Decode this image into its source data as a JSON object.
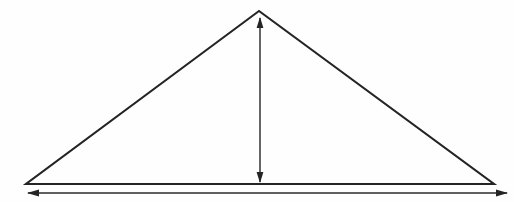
{
  "figure": {
    "type": "geometric-line-diagram",
    "background_color": "#fefefe",
    "line_color": "#242424",
    "canvas": {
      "width": 514,
      "height": 202
    },
    "title": "",
    "caption": ""
  },
  "geometry": {
    "triangle": {
      "name": "triangle-outline",
      "apex": {
        "x": 259,
        "y": 11
      },
      "bottom_left": {
        "x": 26,
        "y": 184
      },
      "bottom_right": {
        "x": 494,
        "y": 184
      },
      "stroke_width": 2.1,
      "closed": true
    },
    "height_arrow": {
      "name": "height-dimension-arrow",
      "orientation": "vertical",
      "double_headed": true,
      "x": 260,
      "y_top": 18,
      "y_bottom": 182,
      "head_length": 11,
      "head_half_width": 3.4,
      "stroke_width": 1.45,
      "label": ""
    },
    "base_arrow": {
      "name": "base-dimension-arrow",
      "orientation": "horizontal",
      "double_headed": true,
      "y": 193,
      "x_left": 28,
      "x_right": 507,
      "head_length": 12,
      "head_half_width": 3.4,
      "stroke_width": 1.45,
      "label": ""
    }
  },
  "labels": {
    "height_label": "",
    "base_label": "",
    "apex_label": "",
    "left_vertex_label": "",
    "right_vertex_label": ""
  }
}
